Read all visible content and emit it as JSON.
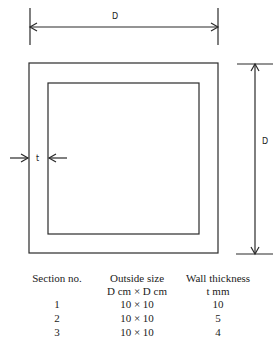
{
  "diagram": {
    "labels": {
      "top_dimension": "D",
      "right_dimension": "D",
      "wall_thickness": "t"
    }
  },
  "table": {
    "headers": [
      {
        "line1": "Section no.",
        "line2": ""
      },
      {
        "line1": "Outside size",
        "line2": "D cm × D cm"
      },
      {
        "line1": "Wall thickness",
        "line2": "t mm"
      }
    ],
    "rows": [
      {
        "section": "1",
        "outside_size": "10 × 10",
        "wall_thickness": "10"
      },
      {
        "section": "2",
        "outside_size": "10 × 10",
        "wall_thickness": "5"
      },
      {
        "section": "3",
        "outside_size": "10 × 10",
        "wall_thickness": "4"
      }
    ]
  },
  "colors": {
    "line": "#2a2a2a",
    "background": "#ffffff"
  }
}
